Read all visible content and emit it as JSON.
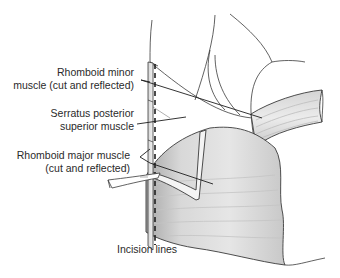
{
  "figure": {
    "type": "anatomical-illustration",
    "colors": {
      "line": "#3a3a3a",
      "muscle_shade": "#bdbdbd",
      "background": "#ffffff",
      "label_text": "#2a2a2a"
    }
  },
  "labels": {
    "rhomboid_minor": {
      "line1": "Rhomboid minor",
      "line2": "muscle (cut and reflected)"
    },
    "serratus_posterior": {
      "line1": "Serratus posterior",
      "line2": "superior muscle"
    },
    "rhomboid_major": {
      "line1": "Rhomboid major muscle",
      "line2": "(cut and reflected)"
    },
    "incision": {
      "line1": "Incision lines"
    }
  }
}
